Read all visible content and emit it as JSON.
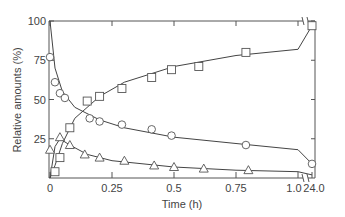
{
  "chart_data": {
    "type": "scatter",
    "title": "",
    "xlabel": "Time (h)",
    "ylabel": "Relative amounts (%)",
    "xlim": [
      0,
      1.05
    ],
    "x_break": {
      "after": 1.0,
      "resume_label": "24.0",
      "resume_value": 24.0
    },
    "ylim": [
      0,
      100
    ],
    "x_ticks": [
      {
        "value": 0,
        "label": "0"
      },
      {
        "value": 0.25,
        "label": "0.25"
      },
      {
        "value": 0.5,
        "label": "0.5"
      },
      {
        "value": 0.75,
        "label": "0.75"
      },
      {
        "value": 1.0,
        "label": "1.0"
      },
      {
        "value": 24.0,
        "label": "24.0"
      }
    ],
    "y_ticks": [
      {
        "value": 25,
        "label": "25"
      },
      {
        "value": 50,
        "label": "50"
      },
      {
        "value": 75,
        "label": "75"
      },
      {
        "value": 100,
        "label": "100"
      }
    ],
    "grid": false,
    "legend": null,
    "series": [
      {
        "name": "circles",
        "marker": "circle",
        "points": [
          {
            "x": 0.0,
            "y": 77
          },
          {
            "x": 0.02,
            "y": 61
          },
          {
            "x": 0.04,
            "y": 54
          },
          {
            "x": 0.06,
            "y": 51
          },
          {
            "x": 0.16,
            "y": 38
          },
          {
            "x": 0.2,
            "y": 36
          },
          {
            "x": 0.29,
            "y": 34
          },
          {
            "x": 0.41,
            "y": 31
          },
          {
            "x": 0.49,
            "y": 27
          },
          {
            "x": 0.79,
            "y": 21
          },
          {
            "x": 24.0,
            "y": 9
          }
        ],
        "fit_curve": [
          {
            "x": 0.0,
            "y": 100
          },
          {
            "x": 0.02,
            "y": 70
          },
          {
            "x": 0.05,
            "y": 55
          },
          {
            "x": 0.1,
            "y": 45
          },
          {
            "x": 0.2,
            "y": 37
          },
          {
            "x": 0.3,
            "y": 32
          },
          {
            "x": 0.5,
            "y": 26
          },
          {
            "x": 0.75,
            "y": 22
          },
          {
            "x": 1.0,
            "y": 18
          },
          {
            "x": 24.0,
            "y": 9
          }
        ]
      },
      {
        "name": "squares",
        "marker": "square",
        "points": [
          {
            "x": 0.02,
            "y": 4
          },
          {
            "x": 0.04,
            "y": 13
          },
          {
            "x": 0.08,
            "y": 32
          },
          {
            "x": 0.15,
            "y": 49
          },
          {
            "x": 0.2,
            "y": 52
          },
          {
            "x": 0.29,
            "y": 57
          },
          {
            "x": 0.41,
            "y": 64
          },
          {
            "x": 0.49,
            "y": 69
          },
          {
            "x": 0.6,
            "y": 71
          },
          {
            "x": 0.79,
            "y": 80
          },
          {
            "x": 24.0,
            "y": 97
          }
        ],
        "fit_curve": [
          {
            "x": 0.0,
            "y": 0
          },
          {
            "x": 0.02,
            "y": 8
          },
          {
            "x": 0.05,
            "y": 22
          },
          {
            "x": 0.1,
            "y": 38
          },
          {
            "x": 0.2,
            "y": 52
          },
          {
            "x": 0.3,
            "y": 61
          },
          {
            "x": 0.5,
            "y": 71
          },
          {
            "x": 0.75,
            "y": 78
          },
          {
            "x": 1.0,
            "y": 82
          },
          {
            "x": 24.0,
            "y": 97
          }
        ]
      },
      {
        "name": "triangles",
        "marker": "triangle",
        "points": [
          {
            "x": 0.0,
            "y": 18
          },
          {
            "x": 0.04,
            "y": 26
          },
          {
            "x": 0.08,
            "y": 21
          },
          {
            "x": 0.14,
            "y": 15
          },
          {
            "x": 0.2,
            "y": 13
          },
          {
            "x": 0.3,
            "y": 11
          },
          {
            "x": 0.42,
            "y": 8
          },
          {
            "x": 0.5,
            "y": 7
          },
          {
            "x": 0.62,
            "y": 6
          },
          {
            "x": 0.8,
            "y": 5
          }
        ],
        "fit_curve": [
          {
            "x": 0.0,
            "y": 0
          },
          {
            "x": 0.02,
            "y": 20
          },
          {
            "x": 0.04,
            "y": 25
          },
          {
            "x": 0.08,
            "y": 21
          },
          {
            "x": 0.15,
            "y": 15
          },
          {
            "x": 0.25,
            "y": 11
          },
          {
            "x": 0.5,
            "y": 7
          },
          {
            "x": 0.75,
            "y": 5
          },
          {
            "x": 1.0,
            "y": 4
          },
          {
            "x": 24.0,
            "y": 2
          }
        ]
      }
    ]
  }
}
